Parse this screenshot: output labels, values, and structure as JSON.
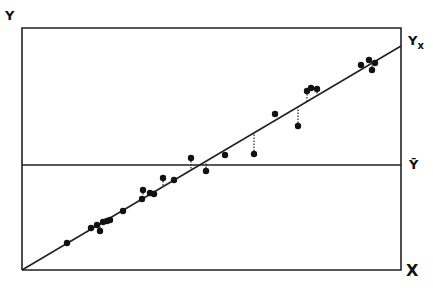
{
  "chart_data": {
    "type": "scatter",
    "title": "",
    "xlabel": "X",
    "ylabel": "Y",
    "regression_label": "Yx",
    "mean_label": "Ȳ",
    "grid": false,
    "legend": null,
    "frame": {
      "left": 22,
      "top": 28,
      "right": 401,
      "bottom": 270
    },
    "regression_line": {
      "x0": 22,
      "y0": 270,
      "x1": 401,
      "y1": 46
    },
    "mean_line_y": 165,
    "points": [
      {
        "x": 67,
        "y": 243,
        "resid": false
      },
      {
        "x": 91,
        "y": 228,
        "resid": false
      },
      {
        "x": 97,
        "y": 225,
        "resid": false
      },
      {
        "x": 100,
        "y": 231,
        "resid": true
      },
      {
        "x": 103,
        "y": 222,
        "resid": false
      },
      {
        "x": 107,
        "y": 221,
        "resid": false
      },
      {
        "x": 110,
        "y": 220,
        "resid": false
      },
      {
        "x": 123,
        "y": 211,
        "resid": false
      },
      {
        "x": 142,
        "y": 199,
        "resid": false
      },
      {
        "x": 143,
        "y": 190,
        "resid": true
      },
      {
        "x": 150,
        "y": 193,
        "resid": false
      },
      {
        "x": 154,
        "y": 194,
        "resid": false
      },
      {
        "x": 163,
        "y": 178,
        "resid": true
      },
      {
        "x": 174,
        "y": 180,
        "resid": false
      },
      {
        "x": 191,
        "y": 158,
        "resid": true
      },
      {
        "x": 206,
        "y": 171,
        "resid": true
      },
      {
        "x": 225,
        "y": 155,
        "resid": false
      },
      {
        "x": 254,
        "y": 154,
        "resid": true
      },
      {
        "x": 275,
        "y": 114,
        "resid": false
      },
      {
        "x": 298,
        "y": 126,
        "resid": true
      },
      {
        "x": 307,
        "y": 91,
        "resid": true
      },
      {
        "x": 311,
        "y": 88,
        "resid": false
      },
      {
        "x": 317,
        "y": 89,
        "resid": true
      },
      {
        "x": 361,
        "y": 65,
        "resid": false
      },
      {
        "x": 369,
        "y": 60,
        "resid": false
      },
      {
        "x": 372,
        "y": 70,
        "resid": true
      },
      {
        "x": 375,
        "y": 63,
        "resid": false
      }
    ]
  },
  "labels": {
    "y_axis": "Y",
    "x_axis": "X",
    "yx": "Y",
    "yx_sub": "x",
    "ybar": "Ȳ"
  }
}
